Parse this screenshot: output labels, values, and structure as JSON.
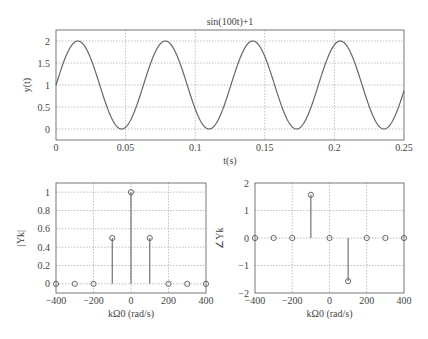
{
  "chart_data": [
    {
      "type": "line",
      "title": "sin(100t)+1",
      "xlabel": "t(s)",
      "ylabel": "y(t)",
      "xlim": [
        0,
        0.25
      ],
      "ylim": [
        -0.25,
        2.25
      ],
      "xticks": [
        0,
        0.05,
        0.1,
        0.15,
        0.2,
        0.25
      ],
      "xtick_labels": [
        "0",
        "0.05",
        "0.1",
        "0.15",
        "0.2",
        "0.25"
      ],
      "yticks": [
        0,
        0.5,
        1,
        1.5,
        2
      ],
      "ytick_labels": [
        "0",
        "0.5",
        "1",
        "1.5",
        "2"
      ],
      "grid": true,
      "function": "sin(100*t)+1",
      "x": [
        0,
        0.0157,
        0.0471,
        0.0785,
        0.11,
        0.1414,
        0.1728,
        0.2042,
        0.2356,
        0.25
      ],
      "values": [
        1,
        2,
        0,
        2,
        0,
        2,
        0,
        2,
        0,
        0.73
      ]
    },
    {
      "type": "stem",
      "title": "",
      "xlabel": "kΩ0 (rad/s)",
      "ylabel": "|Yk|",
      "xlim": [
        -400,
        400
      ],
      "ylim": [
        -0.1,
        1.1
      ],
      "xticks": [
        -400,
        -200,
        0,
        200,
        400
      ],
      "xtick_labels": [
        "−400",
        "−200",
        "0",
        "200",
        "400"
      ],
      "yticks": [
        0,
        0.2,
        0.4,
        0.6,
        0.8,
        1
      ],
      "ytick_labels": [
        "0",
        "0.2",
        "0.4",
        "0.6",
        "0.8",
        "1"
      ],
      "grid": true,
      "x": [
        -400,
        -300,
        -200,
        -100,
        0,
        100,
        200,
        300,
        400
      ],
      "values": [
        0,
        0,
        0,
        0.5,
        1,
        0.5,
        0,
        0,
        0
      ]
    },
    {
      "type": "stem",
      "title": "",
      "xlabel": "kΩ0 (rad/s)",
      "ylabel": "∠Yk",
      "xlim": [
        -400,
        400
      ],
      "ylim": [
        -2,
        2
      ],
      "xticks": [
        -400,
        -200,
        0,
        200,
        400
      ],
      "xtick_labels": [
        "−400",
        "−200",
        "0",
        "200",
        "400"
      ],
      "yticks": [
        -2,
        -1,
        0,
        1,
        2
      ],
      "ytick_labels": [
        "−2",
        "−1",
        "0",
        "1",
        "2"
      ],
      "grid": true,
      "x": [
        -400,
        -300,
        -200,
        -100,
        0,
        100,
        200,
        300,
        400
      ],
      "values": [
        0,
        0,
        0,
        1.5708,
        0,
        -1.5708,
        0,
        0,
        0
      ]
    }
  ]
}
